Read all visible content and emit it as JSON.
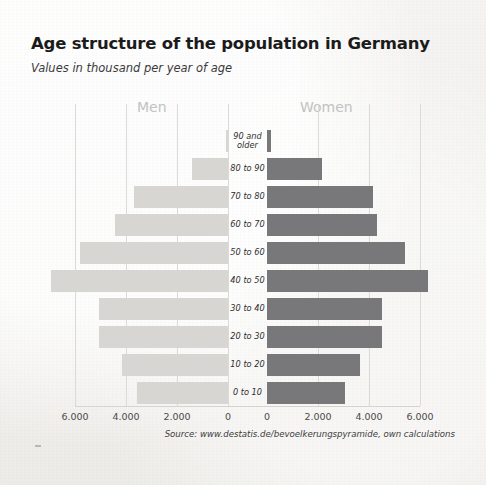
{
  "header": {
    "title": "Age structure of the population in Germany",
    "subtitle": "Values in thousand per year of age"
  },
  "labels": {
    "men": "Men",
    "women": "Women"
  },
  "source": "Source: www.destatis.de/bevoelkerungspyramide, own calculations",
  "colors": {
    "men_bar": "#d7d6d3",
    "women_bar": "#78787a",
    "background": "#f2f1ef",
    "gridline": "#dcdad6",
    "title_text": "#1b1b1b",
    "sex_label": "#c2c2c2"
  },
  "chart_data": {
    "type": "bar",
    "subtype": "population-pyramid",
    "title": "Age structure of the population in Germany",
    "subtitle": "Values in thousand per year of age",
    "xlabel": "",
    "ylabel": "",
    "xlim": [
      -7000,
      7000
    ],
    "grid": true,
    "legend_position": "top",
    "axis_tick_values_left": [
      6000,
      4000,
      2000,
      0
    ],
    "axis_tick_labels_left": [
      "6.000",
      "4.000",
      "2.000",
      "0"
    ],
    "axis_tick_values_right": [
      0,
      2000,
      4000,
      6000
    ],
    "axis_tick_labels_right": [
      "0",
      "2.000",
      "4.000",
      "6.000"
    ],
    "categories": [
      "90 and older",
      "80 to 90",
      "70 to 80",
      "60 to 70",
      "50 to 60",
      "40 to 50",
      "30 to 40",
      "20 to 30",
      "10 to 20",
      "0 to 10"
    ],
    "series": [
      {
        "name": "Men",
        "side": "left",
        "color": "#d7d6d3",
        "values": [
          80,
          1400,
          3700,
          4450,
          5800,
          6950,
          5050,
          5050,
          4150,
          3550
        ]
      },
      {
        "name": "Women",
        "side": "right",
        "color": "#78787a",
        "values": [
          170,
          2150,
          4150,
          4300,
          5400,
          6300,
          4500,
          4500,
          3650,
          3050
        ]
      }
    ]
  },
  "geometry": {
    "center_left_axis_x": 228,
    "center_right_axis_x": 267,
    "px_per_1000": 25.5,
    "row_top_start": 130,
    "row_pitch": 28
  }
}
